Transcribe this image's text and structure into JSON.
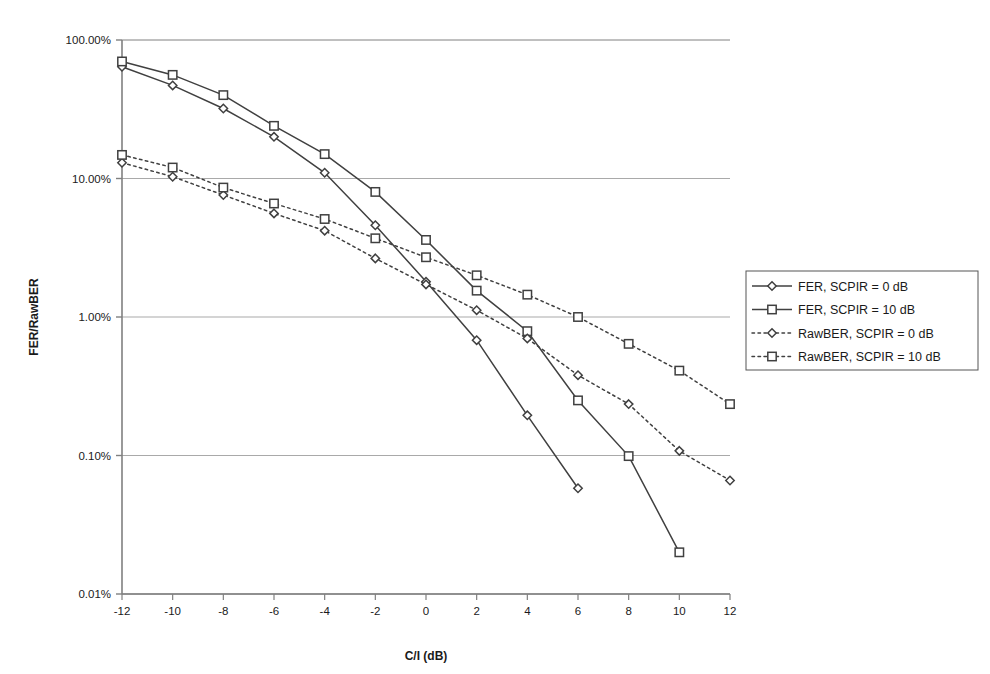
{
  "chart_data": {
    "type": "line",
    "title": "",
    "xlabel": "C/I (dB)",
    "ylabel": "FER/RawBER",
    "x": [
      -12,
      -10,
      -8,
      -6,
      -4,
      -2,
      0,
      2,
      4,
      6,
      8,
      10,
      12
    ],
    "xticklabels": [
      "-12",
      "-10",
      "-8",
      "-6",
      "-4",
      "-2",
      "0",
      "2",
      "4",
      "6",
      "8",
      "10",
      "12"
    ],
    "xlim": [
      -12,
      12
    ],
    "yscale": "log",
    "ylim": [
      0.0001,
      1.0
    ],
    "yticklabels": [
      "100.00%",
      "10.00%",
      "1.00%",
      "0.10%",
      "0.01%"
    ],
    "ytickvalues": [
      100.0,
      10.0,
      1.0,
      0.1,
      0.01
    ],
    "yunit": "%",
    "grid": "horizontal",
    "legend_position": "right",
    "series": [
      {
        "name": "FER, SCPIR = 0 dB",
        "marker": "diamond",
        "linestyle": "solid",
        "color": "#404040",
        "x": [
          -12,
          -10,
          -8,
          -6,
          -4,
          -2,
          0,
          2,
          4,
          6
        ],
        "values": [
          64.0,
          47.0,
          32.0,
          20.0,
          11.0,
          4.6,
          1.8,
          0.68,
          0.195,
          0.058
        ]
      },
      {
        "name": "FER, SCPIR = 10 dB",
        "marker": "square",
        "linestyle": "solid",
        "color": "#404040",
        "x": [
          -12,
          -10,
          -8,
          -6,
          -4,
          -2,
          0,
          2,
          4,
          6,
          8,
          10
        ],
        "values": [
          70.0,
          56.0,
          40.0,
          24.0,
          15.0,
          8.0,
          3.6,
          1.55,
          0.79,
          0.25,
          0.099,
          0.02
        ]
      },
      {
        "name": "RawBER, SCPIR = 0 dB",
        "marker": "diamond",
        "linestyle": "dotted",
        "color": "#404040",
        "x": [
          -12,
          -10,
          -8,
          -6,
          -4,
          -2,
          0,
          2,
          4,
          6,
          8,
          10,
          12
        ],
        "values": [
          13.0,
          10.3,
          7.6,
          5.6,
          4.2,
          2.65,
          1.72,
          1.12,
          0.7,
          0.38,
          0.235,
          0.108,
          0.066
        ]
      },
      {
        "name": "RawBER, SCPIR = 10 dB",
        "marker": "square",
        "linestyle": "dotted",
        "color": "#404040",
        "x": [
          -12,
          -10,
          -8,
          -6,
          -4,
          -2,
          0,
          2,
          4,
          6,
          8,
          10,
          12
        ],
        "values": [
          14.8,
          12.0,
          8.6,
          6.6,
          5.1,
          3.7,
          2.7,
          2.0,
          1.45,
          1.0,
          0.64,
          0.41,
          0.235
        ]
      }
    ]
  },
  "axes": {
    "y_label": "FER/RawBER",
    "x_label": "C/I (dB)"
  },
  "legend": {
    "items": [
      {
        "label": "FER, SCPIR = 0 dB",
        "marker": "diamond",
        "style": "solid"
      },
      {
        "label": "FER, SCPIR = 10 dB",
        "marker": "square",
        "style": "solid"
      },
      {
        "label": "RawBER, SCPIR = 0 dB",
        "marker": "diamond",
        "style": "dotted"
      },
      {
        "label": "RawBER, SCPIR = 10 dB",
        "marker": "square",
        "style": "dotted"
      }
    ]
  },
  "colors": {
    "line": "#404040",
    "axis": "#808080",
    "grid": "#a9a9a9",
    "text": "#1a1a1a",
    "background": "#ffffff"
  }
}
